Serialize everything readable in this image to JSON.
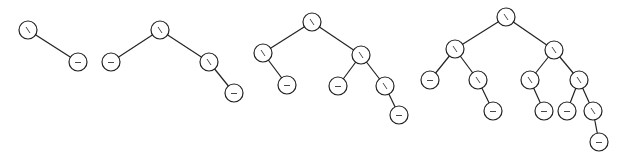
{
  "diagram": {
    "node_radius": 9,
    "colors": {
      "stroke": "#222222",
      "fill": "#ffffff"
    },
    "glyph_legend": {
      "right": "\\",
      "balanced": "–"
    },
    "trees": [
      {
        "id": "tree-1",
        "nodes": [
          {
            "id": "t1-root",
            "x": 28,
            "y": 30,
            "balance": "right"
          },
          {
            "id": "t1-r",
            "x": 78,
            "y": 62,
            "balance": "balanced"
          }
        ],
        "edges": [
          [
            "t1-root",
            "t1-r"
          ]
        ]
      },
      {
        "id": "tree-2",
        "nodes": [
          {
            "id": "t2-root",
            "x": 160,
            "y": 30,
            "balance": "right"
          },
          {
            "id": "t2-l",
            "x": 111,
            "y": 62,
            "balance": "balanced"
          },
          {
            "id": "t2-r",
            "x": 209,
            "y": 62,
            "balance": "right"
          },
          {
            "id": "t2-rr",
            "x": 234,
            "y": 93,
            "balance": "balanced"
          }
        ],
        "edges": [
          [
            "t2-root",
            "t2-l"
          ],
          [
            "t2-root",
            "t2-r"
          ],
          [
            "t2-r",
            "t2-rr"
          ]
        ]
      },
      {
        "id": "tree-3",
        "nodes": [
          {
            "id": "t3-root",
            "x": 312,
            "y": 22,
            "balance": "right"
          },
          {
            "id": "t3-l",
            "x": 263,
            "y": 53,
            "balance": "right"
          },
          {
            "id": "t3-lr",
            "x": 287,
            "y": 85,
            "balance": "balanced"
          },
          {
            "id": "t3-r",
            "x": 361,
            "y": 55,
            "balance": "right"
          },
          {
            "id": "t3-rl",
            "x": 338,
            "y": 86,
            "balance": "balanced"
          },
          {
            "id": "t3-rr",
            "x": 385,
            "y": 86,
            "balance": "right"
          },
          {
            "id": "t3-rrr",
            "x": 399,
            "y": 115,
            "balance": "balanced"
          }
        ],
        "edges": [
          [
            "t3-root",
            "t3-l"
          ],
          [
            "t3-l",
            "t3-lr"
          ],
          [
            "t3-root",
            "t3-r"
          ],
          [
            "t3-r",
            "t3-rl"
          ],
          [
            "t3-r",
            "t3-rr"
          ],
          [
            "t3-rr",
            "t3-rrr"
          ]
        ]
      },
      {
        "id": "tree-4",
        "nodes": [
          {
            "id": "t4-root",
            "x": 506,
            "y": 17,
            "balance": "right"
          },
          {
            "id": "t4-l",
            "x": 455,
            "y": 49,
            "balance": "right"
          },
          {
            "id": "t4-ll",
            "x": 430,
            "y": 80,
            "balance": "balanced"
          },
          {
            "id": "t4-lr",
            "x": 478,
            "y": 80,
            "balance": "right"
          },
          {
            "id": "t4-lrr",
            "x": 493,
            "y": 111,
            "balance": "balanced"
          },
          {
            "id": "t4-r",
            "x": 554,
            "y": 50,
            "balance": "right"
          },
          {
            "id": "t4-rl",
            "x": 530,
            "y": 80,
            "balance": "right"
          },
          {
            "id": "t4-rlr",
            "x": 544,
            "y": 111,
            "balance": "balanced"
          },
          {
            "id": "t4-rr",
            "x": 579,
            "y": 80,
            "balance": "right"
          },
          {
            "id": "t4-rrl",
            "x": 567,
            "y": 111,
            "balance": "balanced"
          },
          {
            "id": "t4-rrr",
            "x": 593,
            "y": 111,
            "balance": "right"
          },
          {
            "id": "t4-rrrr",
            "x": 599,
            "y": 142,
            "balance": "balanced"
          }
        ],
        "edges": [
          [
            "t4-root",
            "t4-l"
          ],
          [
            "t4-l",
            "t4-ll"
          ],
          [
            "t4-l",
            "t4-lr"
          ],
          [
            "t4-lr",
            "t4-lrr"
          ],
          [
            "t4-root",
            "t4-r"
          ],
          [
            "t4-r",
            "t4-rl"
          ],
          [
            "t4-rl",
            "t4-rlr"
          ],
          [
            "t4-r",
            "t4-rr"
          ],
          [
            "t4-rr",
            "t4-rrl"
          ],
          [
            "t4-rr",
            "t4-rrr"
          ],
          [
            "t4-rrr",
            "t4-rrrr"
          ]
        ]
      }
    ]
  }
}
